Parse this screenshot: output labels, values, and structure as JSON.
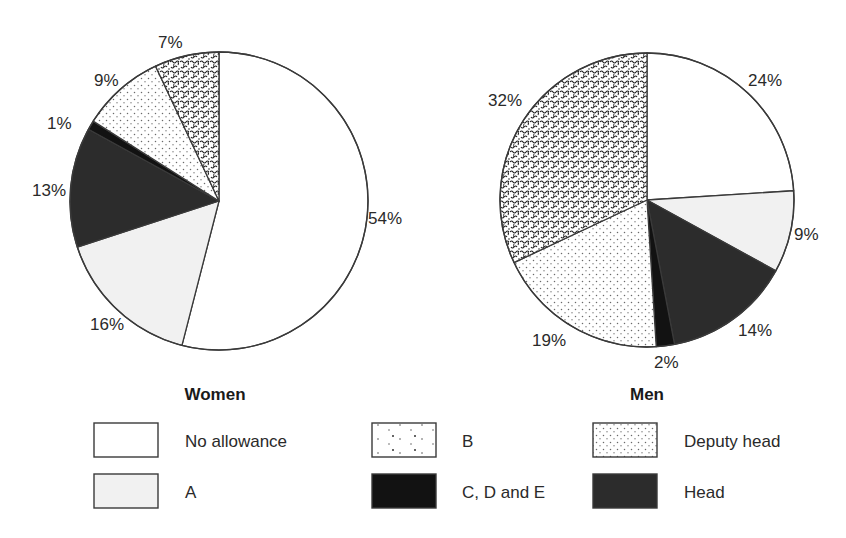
{
  "categories": [
    {
      "key": "none",
      "label": "No allowance",
      "fill": "#ffffff",
      "pattern": "none"
    },
    {
      "key": "a",
      "label": "A",
      "fill": "#f1f1f1",
      "pattern": "none"
    },
    {
      "key": "b",
      "label": "B",
      "fill": "#ffffff",
      "pattern": "squiggle"
    },
    {
      "key": "cde",
      "label": "C, D and E",
      "fill": "#121212",
      "pattern": "none"
    },
    {
      "key": "deputy",
      "label": "Deputy head",
      "fill": "#ffffff",
      "pattern": "dots"
    },
    {
      "key": "head",
      "label": "Head",
      "fill": "#2c2c2c",
      "pattern": "none"
    }
  ],
  "legend": {
    "items": [
      {
        "key": "none",
        "label": "No allowance",
        "box_x": 94,
        "box_y": 423,
        "text_x": 185,
        "text_y": 447
      },
      {
        "key": "a",
        "label": "A",
        "box_x": 94,
        "box_y": 474,
        "text_x": 185,
        "text_y": 498
      },
      {
        "key": "b",
        "label": "B",
        "box_x": 372,
        "box_y": 423,
        "text_x": 462,
        "text_y": 447
      },
      {
        "key": "cde",
        "label": "C, D and E",
        "box_x": 372,
        "box_y": 474,
        "text_x": 462,
        "text_y": 498
      },
      {
        "key": "deputy",
        "label": "Deputy head",
        "box_x": 593,
        "box_y": 423,
        "text_x": 684,
        "text_y": 447
      },
      {
        "key": "head",
        "label": "Head",
        "box_x": 593,
        "box_y": 474,
        "text_x": 684,
        "text_y": 498
      }
    ],
    "box_w": 64,
    "box_h": 34
  },
  "chart_data": [
    {
      "type": "pie",
      "title": "Women",
      "center": [
        219,
        201
      ],
      "radius": 149,
      "title_pos": [
        215,
        400
      ],
      "start": "top",
      "direction": "clockwise",
      "slices": [
        {
          "category": "No allowance",
          "key": "none",
          "value": 54,
          "label": "54%",
          "label_pos": [
            368,
            224
          ]
        },
        {
          "category": "A",
          "key": "a",
          "value": 16,
          "label": "16%",
          "label_pos": [
            90,
            330
          ]
        },
        {
          "category": "Head",
          "key": "head",
          "value": 13,
          "label": "13%",
          "label_pos": [
            32,
            196
          ]
        },
        {
          "category": "C, D and E",
          "key": "cde",
          "value": 1,
          "label": "1%",
          "label_pos": [
            47,
            129
          ]
        },
        {
          "category": "Deputy head",
          "key": "deputy",
          "value": 9,
          "label": "9%",
          "label_pos": [
            94,
            86
          ]
        },
        {
          "category": "B",
          "key": "b",
          "value": 7,
          "label": "7%",
          "label_pos": [
            158,
            48
          ]
        }
      ]
    },
    {
      "type": "pie",
      "title": "Men",
      "center": [
        647,
        200
      ],
      "radius": 147,
      "title_pos": [
        647,
        400
      ],
      "start": "top",
      "direction": "clockwise",
      "slices": [
        {
          "category": "No allowance",
          "key": "none",
          "value": 24,
          "label": "24%",
          "label_pos": [
            748,
            86
          ]
        },
        {
          "category": "A",
          "key": "a",
          "value": 9,
          "label": "9%",
          "label_pos": [
            794,
            240
          ]
        },
        {
          "category": "Head",
          "key": "head",
          "value": 14,
          "label": "14%",
          "label_pos": [
            738,
            336
          ]
        },
        {
          "category": "C, D and E",
          "key": "cde",
          "value": 2,
          "label": "2%",
          "label_pos": [
            654,
            368
          ]
        },
        {
          "category": "Deputy head",
          "key": "deputy",
          "value": 19,
          "label": "19%",
          "label_pos": [
            532,
            346
          ]
        },
        {
          "category": "B",
          "key": "b",
          "value": 32,
          "label": "32%",
          "label_pos": [
            488,
            106
          ]
        }
      ]
    }
  ]
}
